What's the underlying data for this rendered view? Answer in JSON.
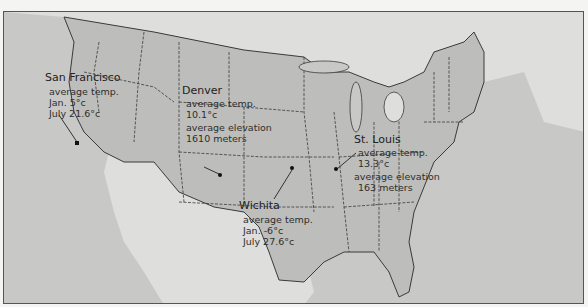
{
  "map": {
    "title": "United States climate and elevation annotations",
    "colors": {
      "ocean": "#c8c8c6",
      "us_land": "#bdbdbb",
      "foreign_land": "#dededc",
      "border": "#3a3a3a"
    },
    "cities": [
      {
        "name": "San Francisco",
        "lines": [
          "average temp.",
          "Jan. 5°c",
          "July 21.6°c"
        ]
      },
      {
        "name": "Denver",
        "lines": [
          "average temp.",
          "10.1°c",
          "average elevation",
          "1610 meters"
        ]
      },
      {
        "name": "St. Louis",
        "lines": [
          "average temp.",
          "13.3°c",
          "average elevation",
          "163 meters"
        ]
      },
      {
        "name": "Wichita",
        "lines": [
          "average temp.",
          "Jan. -6°c",
          "July 27.6°c"
        ]
      }
    ]
  }
}
